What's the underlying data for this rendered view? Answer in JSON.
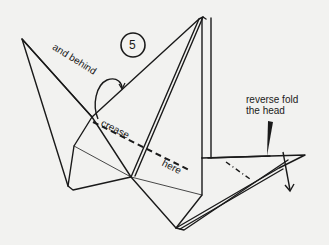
{
  "diagram": {
    "step_number": "5",
    "labels": {
      "and_behind": "and behind",
      "crease": "crease",
      "here": "here",
      "reverse_fold_line1": "reverse fold",
      "reverse_fold_line2": "the head"
    },
    "colors": {
      "background": "#f2f2f0",
      "ink": "#1a1a1a"
    }
  }
}
